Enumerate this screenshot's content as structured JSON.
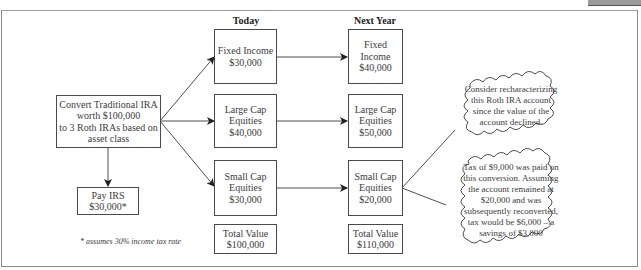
{
  "header_tab": {
    "color": "#9a9a9a"
  },
  "columns": {
    "today": "Today",
    "next_year": "Next Year"
  },
  "source": {
    "lines": [
      "Convert Traditional IRA",
      "worth $100,000",
      "to 3 Roth IRAs based on",
      "asset class"
    ]
  },
  "irs": {
    "lines": [
      "Pay IRS",
      "$30,000*"
    ]
  },
  "footnote": "* assumes 30% income tax rate",
  "today": [
    {
      "lines": [
        "Fixed Income",
        "$30,000"
      ]
    },
    {
      "lines": [
        "Large Cap",
        "Equities",
        "$40,000"
      ]
    },
    {
      "lines": [
        "Small Cap",
        "Equities",
        "$30,000"
      ]
    }
  ],
  "today_total": {
    "lines": [
      "Total Value",
      "$100,000"
    ]
  },
  "next_year": [
    {
      "lines": [
        "Fixed Income",
        "$40,000"
      ]
    },
    {
      "lines": [
        "Large Cap",
        "Equities",
        "$50,000"
      ]
    },
    {
      "lines": [
        "Small Cap",
        "Equities",
        "$20,000"
      ]
    }
  ],
  "next_year_total": {
    "lines": [
      "Total Value",
      "$110,000"
    ]
  },
  "callouts": [
    {
      "lines": [
        "Consider recharacterizing",
        "this Roth IRA account",
        "since the value of the",
        "account declined."
      ]
    },
    {
      "lines": [
        "Tax of $9,000 was paid on",
        "this conversion. Assuming",
        "the account remained at",
        "$20,000 and was",
        "subsequently reconverted,",
        "tax would be $6,000 – a",
        "savings of $3,000"
      ]
    }
  ]
}
